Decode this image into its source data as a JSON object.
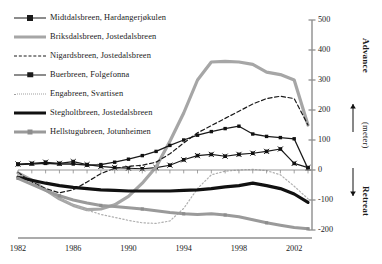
{
  "figure": {
    "title": "",
    "axis_right_label_advance": "Advance",
    "axis_right_label_unit": "(meter)",
    "axis_right_label_retreat": "Retreat",
    "arrow_up": "arrow-up-icon",
    "arrow_down": "arrow-down-icon"
  },
  "legend": {
    "position": "top-left",
    "items": [
      {
        "label": "Midtdalsbreen, Hardangerjøkulen",
        "style": "solid-marker",
        "color": "#1a1a1a",
        "width": 1.1,
        "marker": "x-square"
      },
      {
        "label": "Briksdalsbreen, Jostedalsbreen",
        "style": "solid",
        "color": "#a6a6a6",
        "width": 3.2,
        "marker": "none"
      },
      {
        "label": "Nigardsbreen, Jostedalsbreen",
        "style": "dashed",
        "color": "#1a1a1a",
        "width": 1.2,
        "marker": "none"
      },
      {
        "label": "Buerbreen, Folgefonna",
        "style": "solid-marker",
        "color": "#1a1a1a",
        "width": 1.3,
        "marker": "square"
      },
      {
        "label": "Engabreen, Svartisen",
        "style": "dotted",
        "color": "#b0b0b0",
        "width": 1.2,
        "marker": "none"
      },
      {
        "label": "Stegholtbreen, Jostedalsbreen",
        "style": "solid",
        "color": "#111111",
        "width": 3.2,
        "marker": "none"
      },
      {
        "label": "Hellstugubreen, Jotunheimen",
        "style": "solid-marker",
        "color": "#9a9a9a",
        "width": 3.0,
        "marker": "square-gray"
      }
    ]
  },
  "chart_data": {
    "type": "line",
    "title": "",
    "xlabel": "",
    "ylabel": "(meter)",
    "xlim": [
      1982,
      2003
    ],
    "ylim": [
      -200,
      500
    ],
    "ytick_values": [
      -200,
      -100,
      0,
      100,
      200,
      300,
      400,
      500
    ],
    "ytick_labels": [
      "-200",
      "-100",
      "0",
      "100",
      "200",
      "300",
      "400",
      "500"
    ],
    "xtick_values": [
      1982,
      1986,
      1990,
      1994,
      1998,
      2002
    ],
    "xtick_labels": [
      "1982",
      "1986",
      "1990",
      "1994",
      "1998",
      "2002"
    ],
    "grid": false,
    "zero_line": true,
    "y_axis_side": "right",
    "x": [
      1982,
      1983,
      1984,
      1985,
      1986,
      1987,
      1988,
      1989,
      1990,
      1991,
      1992,
      1993,
      1994,
      1995,
      1996,
      1997,
      1998,
      1999,
      2000,
      2001,
      2002,
      2003
    ],
    "series": [
      {
        "name": "Midtdalsbreen, Hardangerjøkulen",
        "values": [
          20,
          22,
          26,
          22,
          28,
          18,
          12,
          8,
          6,
          4,
          8,
          16,
          34,
          48,
          52,
          46,
          52,
          56,
          62,
          70,
          22,
          8
        ]
      },
      {
        "name": "Briksdalsbreen, Jostedalsbreen",
        "values": [
          -10,
          -34,
          -66,
          -96,
          -118,
          -132,
          -130,
          -116,
          -88,
          -44,
          10,
          96,
          190,
          300,
          360,
          362,
          360,
          352,
          326,
          318,
          300,
          150
        ]
      },
      {
        "name": "Nigardsbreen, Jostedalsbreen",
        "values": [
          -8,
          -40,
          -62,
          -76,
          -66,
          -40,
          -12,
          6,
          12,
          16,
          26,
          54,
          90,
          124,
          148,
          172,
          196,
          220,
          238,
          246,
          238,
          150
        ]
      },
      {
        "name": "Buerbreen, Folgefonna",
        "values": [
          18,
          20,
          22,
          20,
          20,
          16,
          18,
          26,
          36,
          48,
          62,
          82,
          100,
          116,
          128,
          138,
          146,
          120,
          112,
          108,
          104,
          4
        ]
      },
      {
        "name": "Engabreen, Svartisen",
        "values": [
          -12,
          -40,
          -70,
          -94,
          -116,
          -134,
          -148,
          -158,
          -168,
          -176,
          -178,
          -170,
          -128,
          -62,
          -16,
          -4,
          0,
          2,
          -2,
          -16,
          -54,
          -96
        ]
      },
      {
        "name": "Stegholtbreen, Jostedalsbreen",
        "values": [
          -24,
          -34,
          -44,
          -52,
          -58,
          -62,
          -66,
          -68,
          -70,
          -70,
          -70,
          -70,
          -68,
          -66,
          -62,
          -56,
          -52,
          -44,
          -52,
          -62,
          -80,
          -108
        ]
      },
      {
        "name": "Hellstugubreen, Jotunheimen",
        "values": [
          -28,
          -48,
          -68,
          -86,
          -100,
          -110,
          -118,
          -122,
          -126,
          -130,
          -136,
          -142,
          -146,
          -148,
          -146,
          -150,
          -156,
          -166,
          -176,
          -184,
          -192,
          -196
        ]
      }
    ]
  }
}
